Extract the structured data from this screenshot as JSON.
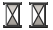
{
  "canvas": {
    "width": 53,
    "height": 30,
    "background_color": "#ffffff"
  },
  "icons": [
    {
      "name": "hourglass-icon",
      "semantic": "hourglass-busy-wait-icon",
      "label": "Hourglass",
      "index": 1,
      "x": 2,
      "y": 2,
      "width": 21,
      "height": 26,
      "colors": {
        "frame": "#2b2b2b",
        "rail": "#6e6e6e",
        "rail_highlight": "#c9c9c9",
        "sand_top": "#cfcbc6",
        "sand_bottom": "#a8a39d",
        "glass": "#ffffff"
      }
    },
    {
      "name": "hourglass-icon",
      "semantic": "hourglass-busy-wait-icon",
      "label": "Hourglass",
      "index": 2,
      "x": 28,
      "y": 2,
      "width": 21,
      "height": 26,
      "colors": {
        "frame": "#2b2b2b",
        "rail": "#6e6e6e",
        "rail_highlight": "#c9c9c9",
        "sand_top": "#cfcbc6",
        "sand_bottom": "#a8a39d",
        "glass": "#ffffff"
      }
    }
  ]
}
